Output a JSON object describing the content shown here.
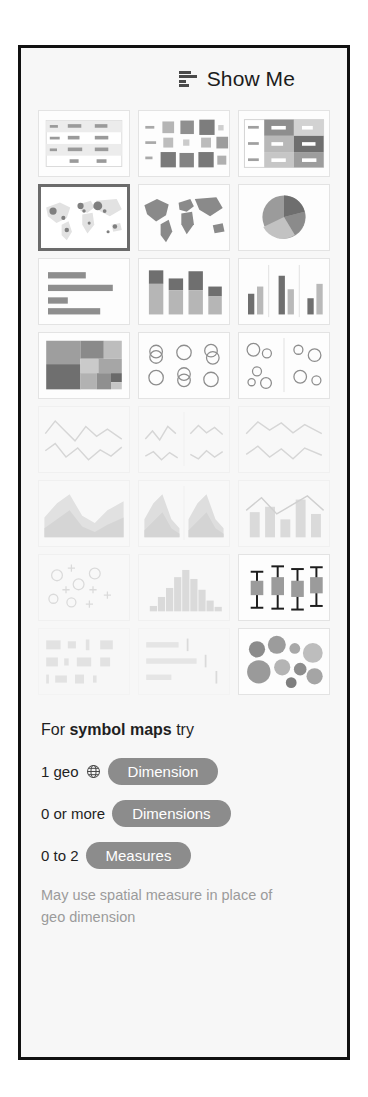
{
  "panel": {
    "title": "Show Me",
    "title_icon": "show-me-bars-icon",
    "border_color": "#111111",
    "background_color": "#f7f7f7"
  },
  "thumbnails": [
    {
      "id": "text-table",
      "label": "Text Table",
      "state": "enabled",
      "row": 1,
      "col": 1
    },
    {
      "id": "heat-map",
      "label": "Heat Map",
      "state": "enabled",
      "row": 1,
      "col": 2
    },
    {
      "id": "highlight-table",
      "label": "Highlight Table",
      "state": "enabled",
      "row": 1,
      "col": 3
    },
    {
      "id": "symbol-map",
      "label": "Symbol Maps",
      "state": "selected",
      "row": 2,
      "col": 1
    },
    {
      "id": "filled-map",
      "label": "Maps",
      "state": "enabled",
      "row": 2,
      "col": 2
    },
    {
      "id": "pie-chart",
      "label": "Pie Charts",
      "state": "enabled",
      "row": 2,
      "col": 3
    },
    {
      "id": "horizontal-bars",
      "label": "Horizontal Bars",
      "state": "enabled",
      "row": 3,
      "col": 1
    },
    {
      "id": "stacked-bars",
      "label": "Stacked Bars",
      "state": "enabled",
      "row": 3,
      "col": 2
    },
    {
      "id": "side-by-side-bars",
      "label": "Side-by-Side Bars",
      "state": "enabled",
      "row": 3,
      "col": 3
    },
    {
      "id": "treemap",
      "label": "Treemaps",
      "state": "enabled",
      "row": 4,
      "col": 1
    },
    {
      "id": "circle-views",
      "label": "Circle Views",
      "state": "enabled",
      "row": 4,
      "col": 2
    },
    {
      "id": "side-by-side-circles",
      "label": "Side-by-Side Circles",
      "state": "enabled",
      "row": 4,
      "col": 3
    },
    {
      "id": "lines-continuous",
      "label": "Lines (Continuous)",
      "state": "disabled",
      "row": 5,
      "col": 1
    },
    {
      "id": "lines-discrete",
      "label": "Lines (Discrete)",
      "state": "disabled",
      "row": 5,
      "col": 2
    },
    {
      "id": "dual-lines",
      "label": "Dual Lines",
      "state": "disabled",
      "row": 5,
      "col": 3
    },
    {
      "id": "area-continuous",
      "label": "Area Charts (Continuous)",
      "state": "disabled",
      "row": 6,
      "col": 1
    },
    {
      "id": "area-discrete",
      "label": "Area Charts (Discrete)",
      "state": "disabled",
      "row": 6,
      "col": 2
    },
    {
      "id": "dual-combination",
      "label": "Dual Combination",
      "state": "disabled",
      "row": 6,
      "col": 3
    },
    {
      "id": "scatter-plot",
      "label": "Scatter Plots",
      "state": "disabled",
      "row": 7,
      "col": 1
    },
    {
      "id": "histogram",
      "label": "Histogram",
      "state": "disabled",
      "row": 7,
      "col": 2
    },
    {
      "id": "box-and-whisker",
      "label": "Box-and-Whisker Plots",
      "state": "enabled",
      "row": 7,
      "col": 3
    },
    {
      "id": "gantt",
      "label": "Gantt",
      "state": "faint",
      "row": 8,
      "col": 1
    },
    {
      "id": "bullet-graph",
      "label": "Bullet Graphs",
      "state": "faint",
      "row": 8,
      "col": 2
    },
    {
      "id": "packed-bubbles",
      "label": "Packed Bubbles",
      "state": "enabled",
      "row": 8,
      "col": 3
    }
  ],
  "advice": {
    "head_prefix": "For ",
    "head_emphasis": "symbol maps",
    "head_suffix": " try",
    "requirements": [
      {
        "label": "1 geo",
        "icon": "globe-icon",
        "pill": "Dimension"
      },
      {
        "label": "0 or more",
        "icon": null,
        "pill": "Dimensions"
      },
      {
        "label": "0 to 2",
        "icon": null,
        "pill": "Measures"
      }
    ],
    "note": "May use spatial measure in place of geo dimension",
    "pill_color": "#8c8c8c",
    "note_color": "#9b9b9b"
  }
}
